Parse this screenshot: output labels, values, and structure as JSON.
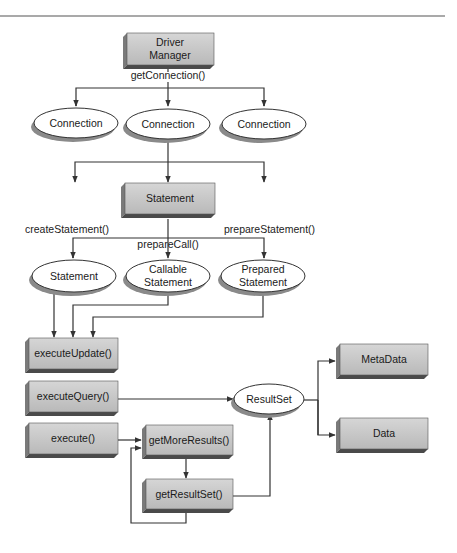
{
  "diagram": {
    "colors": {
      "box_fill": "#c8c8c8",
      "box_side": "#7a7a7a",
      "box_bottom": "#4a4a4a",
      "ellipse_fill": "#ffffff",
      "ellipse_shadow": "#8a8a8a",
      "line": "#333333",
      "rule": "#555555"
    },
    "nodes": {
      "driver_manager": {
        "line1": "Driver",
        "line2": "Manager"
      },
      "connection_1": {
        "label": "Connection"
      },
      "connection_2": {
        "label": "Connection"
      },
      "connection_3": {
        "label": "Connection"
      },
      "statement_box": {
        "label": "Statement"
      },
      "statement_ellipse": {
        "label": "Statement"
      },
      "callable_statement": {
        "line1": "Callable",
        "line2": "Statement"
      },
      "prepared_statement": {
        "line1": "Prepared",
        "line2": "Statement"
      },
      "execute_update": {
        "label": "executeUpdate()"
      },
      "execute_query": {
        "label": "executeQuery()"
      },
      "execute": {
        "label": "execute()"
      },
      "get_more_results": {
        "label": "getMoreResults()"
      },
      "get_result_set": {
        "label": "getResultSet()"
      },
      "result_set": {
        "label": "ResultSet"
      },
      "metadata": {
        "label": "MetaData"
      },
      "data": {
        "label": "Data"
      }
    },
    "edge_labels": {
      "get_connection": "getConnection()",
      "create_statement": "createStatement()",
      "prepare_call": "prepareCall()",
      "prepare_statement": "prepareStatement()"
    }
  }
}
